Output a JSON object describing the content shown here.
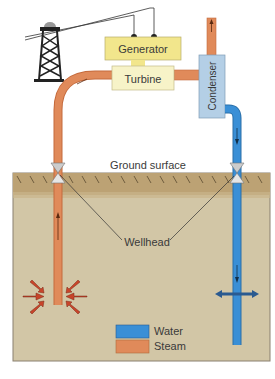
{
  "diagram": {
    "labels": {
      "generator": "Generator",
      "turbine": "Turbine",
      "condenser": "Condenser",
      "ground_surface": "Ground surface",
      "wellhead": "Wellhead"
    },
    "legend": [
      {
        "label": "Water",
        "color": "#3a8fd6"
      },
      {
        "label": "Steam",
        "color": "#e08a5a"
      }
    ],
    "colors": {
      "ground": "#cfc2a0",
      "ground_top": "#b89d6a",
      "steam_pipe": "#e08a5a",
      "water_pipe": "#3a8fd6",
      "generator": "#f2e68c",
      "turbine": "#f7f3c8",
      "condenser": "#b4cfe6"
    }
  }
}
